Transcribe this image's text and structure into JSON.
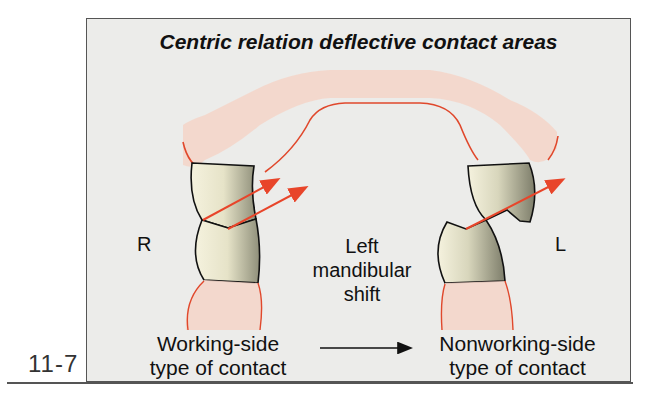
{
  "figure_number": "11-7",
  "title": "Centric relation deflective contact areas",
  "labels": {
    "right_side": "R",
    "left_side": "L",
    "shift_line1": "Left",
    "shift_line2": "mandibular",
    "shift_line3": "shift",
    "working_line1": "Working-side",
    "working_line2": "type of contact",
    "nonworking_line1": "Nonworking-side",
    "nonworking_line2": "type of contact"
  },
  "colors": {
    "gingiva_fill": "#f4d5c8",
    "gingiva_line": "#e0482c",
    "arrow": "#e8452a",
    "tooth_light": "#f3f0dc",
    "tooth_dark": "#8c8c78",
    "background": "#ececea"
  }
}
